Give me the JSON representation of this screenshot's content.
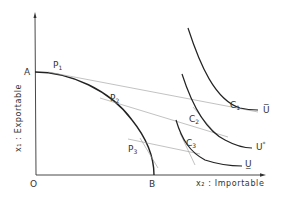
{
  "diagram": {
    "axes": {
      "y_label": "x₁ : Exportable",
      "x_label": "x₂ : Importable",
      "origin_label": "O"
    },
    "points": {
      "A": "A",
      "B": "B",
      "P1": {
        "main": "P",
        "sub": "1"
      },
      "P2": {
        "main": "P",
        "sub": "2"
      },
      "P3": {
        "main": "P",
        "sub": "3"
      },
      "C1": {
        "main": "C",
        "sub": "1"
      },
      "C2": {
        "main": "C",
        "sub": "2"
      },
      "C3": {
        "main": "C",
        "sub": "3"
      }
    },
    "curves": {
      "U_bar": "U̅",
      "U_star": {
        "main": "U",
        "sup": "*"
      },
      "U_under": "U̲"
    },
    "colors": {
      "stroke": "#222222",
      "thin": "#888888",
      "text": "#333333"
    }
  }
}
